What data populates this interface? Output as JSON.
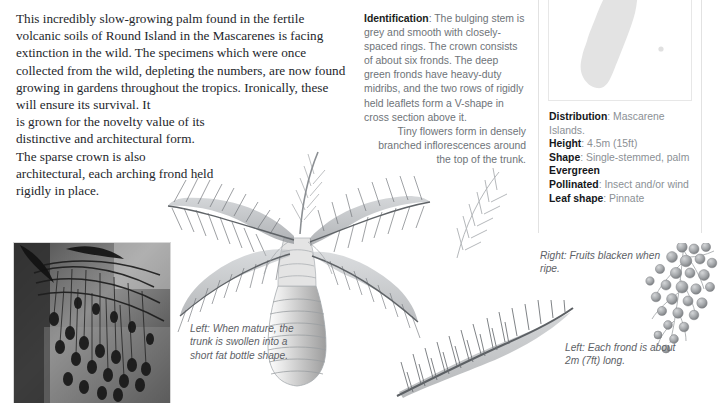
{
  "article": {
    "intro_full": "This incredibly slow-growing palm found in the fertile volcanic soils of Round Island in the Mascarenes is facing extinction in the wild. The specimens which were once collected from the wild, depleting the numbers, are now found growing in gardens throughout the tropics. Ironically, these will ensure its survival. It",
    "intro_narrow": "is grown for the novelty value of its distinctive and architectural form. The sparse crown is also architectural, each arching frond held rigidly in place."
  },
  "identification": {
    "label": "Identification",
    "separator": ": ",
    "text_block": "The bulging stem is grey and smooth with closely-spaced rings. The crown consists of about six fronds. The deep green fronds have heavy-duty midribs, and the two rows of rigidly held leaflets form a V-shape in cross section above it.",
    "text_taper": "Tiny flowers form in densely branched inflorescences around the top of the trunk."
  },
  "facts": [
    {
      "label": "Distribution",
      "sep": ": ",
      "value": "Mascarene Islands."
    },
    {
      "label": "Height",
      "sep": ": ",
      "value": "4.5m (15ft)"
    },
    {
      "label": "Shape",
      "sep": ": ",
      "value": "Single-stemmed, palm"
    },
    {
      "label": "Evergreen",
      "sep": "",
      "value": ""
    },
    {
      "label": "Pollinated",
      "sep": ": ",
      "value": "Insect and/or wind"
    },
    {
      "label": "Leaf shape",
      "sep": ": ",
      "value": "Pinnate"
    }
  ],
  "captions": {
    "trunk": "Left: When mature, the trunk is swollen into a short fat bottle shape.",
    "fruits": "Right: Fruits blacken when ripe.",
    "frond": "Left: Each frond is about 2m (7ft) long."
  },
  "figures": {
    "map_name": "madagascar-mascarene-distribution-map",
    "palm_name": "bottle-palm-whole-plant-illustration",
    "frond_name": "single-frond-illustration",
    "fruits_name": "fruit-cluster-illustration",
    "photo_name": "palm-fruiting-branches-photograph"
  },
  "colors": {
    "body_text": "#23262b",
    "muted_text": "#6e7378",
    "heading_text": "#15171a",
    "caption_text": "#5d6166",
    "panel_border": "#e2e2e2",
    "map_land": "#e3e3e3",
    "illustration_ink": "#8d9196"
  }
}
